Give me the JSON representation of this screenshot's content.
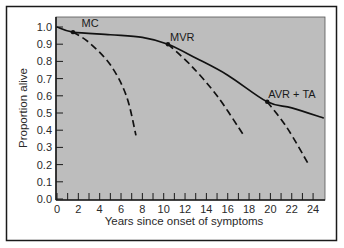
{
  "chart_data": {
    "type": "line",
    "title": "",
    "xlabel": "Years since onset of symptoms",
    "ylabel": "Proportion alive",
    "xlim": [
      0,
      25
    ],
    "ylim": [
      0.0,
      1.04
    ],
    "x_ticks": [
      0,
      2,
      4,
      6,
      8,
      10,
      12,
      14,
      16,
      18,
      20,
      22,
      24
    ],
    "x_minor_ticks": [
      1,
      3,
      5,
      7,
      9,
      11,
      13,
      15,
      17,
      19,
      21,
      23
    ],
    "y_ticks": [
      "0.0",
      "0.1",
      "0.2",
      "0.3",
      "0.4",
      "0.5",
      "0.6",
      "0.7",
      "0.8",
      "0.9",
      "1.0"
    ],
    "grid": false,
    "legend": null,
    "series": [
      {
        "name": "Survival with surgery (solid)",
        "style": "solid",
        "points": [
          [
            0,
            1.0
          ],
          [
            1.5,
            0.97
          ],
          [
            5,
            0.955
          ],
          [
            8,
            0.94
          ],
          [
            10.4,
            0.9
          ],
          [
            13,
            0.82
          ],
          [
            16,
            0.72
          ],
          [
            19.7,
            0.565
          ],
          [
            22,
            0.53
          ],
          [
            25,
            0.47
          ]
        ]
      },
      {
        "name": "MC (dashed)",
        "style": "dashed",
        "points": [
          [
            1.5,
            0.97
          ],
          [
            3,
            0.91
          ],
          [
            5,
            0.78
          ],
          [
            6.5,
            0.6
          ],
          [
            7.4,
            0.37
          ]
        ]
      },
      {
        "name": "MVR (dashed)",
        "style": "dashed",
        "points": [
          [
            10.4,
            0.9
          ],
          [
            12.5,
            0.78
          ],
          [
            15,
            0.6
          ],
          [
            17.5,
            0.37
          ]
        ]
      },
      {
        "name": "AVR + TA (dashed)",
        "style": "dashed",
        "points": [
          [
            19.7,
            0.565
          ],
          [
            21.5,
            0.42
          ],
          [
            23.5,
            0.21
          ]
        ]
      }
    ],
    "markers": [
      {
        "label": "MC",
        "x": 1.5,
        "y": 0.97
      },
      {
        "label": "MVR",
        "x": 10.4,
        "y": 0.9
      },
      {
        "label": "AVR + TA",
        "x": 19.7,
        "y": 0.565
      }
    ],
    "annotations": [
      {
        "text": "MC",
        "x": 2.3,
        "y": 1.0
      },
      {
        "text": "MVR",
        "x": 10.6,
        "y": 0.92
      },
      {
        "text": "AVR + TA",
        "x": 19.8,
        "y": 0.59
      }
    ]
  },
  "colors": {
    "plot_bg": "#bdbdbd",
    "line": "#111111",
    "frame": "#1a1a1a",
    "page_bg": "#ffffff"
  }
}
